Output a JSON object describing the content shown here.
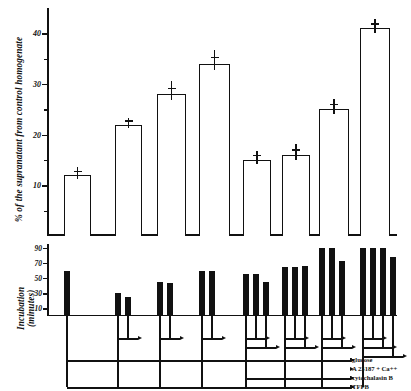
{
  "figure": {
    "type": "two-panel-scientific-figure",
    "top_axis_title": "% of the supranatant from control homogenate",
    "bottom_axis_title_line1": "Incubation",
    "bottom_axis_title_line2": "(minutes)"
  },
  "chart_data": {
    "type": "bar",
    "title": "",
    "xlabel": "",
    "ylabel": "% of the supranatant from control homogenate",
    "ylim": [
      0,
      45
    ],
    "yticks": [
      10,
      20,
      30,
      40
    ],
    "ytick_labels": [
      "10",
      "20",
      "30",
      "40"
    ],
    "grid": false,
    "legend_position": "bottom-right",
    "categories": [
      "1",
      "2",
      "3",
      "4",
      "5",
      "6",
      "7",
      "8"
    ],
    "values": [
      12,
      22,
      28,
      34,
      15,
      16,
      25,
      41
    ],
    "errors": [
      1.4,
      1.2,
      2.2,
      2.4,
      1.6,
      1.8,
      1.8,
      1.6
    ],
    "conditions": [
      "glucose",
      "A 23187 + Ca++",
      "cytochalasin B",
      "TFPB"
    ],
    "timeline": {
      "ylabel": "Incubation (minutes)",
      "ylim": [
        0,
        95
      ],
      "yticks": [
        10,
        30,
        50,
        70,
        90
      ],
      "ytick_labels": [
        "10",
        "30",
        "50",
        "70",
        "90"
      ],
      "groups": [
        {
          "index": 1,
          "bars": [
            60
          ],
          "arrows": [
            "glucose",
            "TFPB"
          ]
        },
        {
          "index": 2,
          "bars": [
            30,
            25
          ],
          "arrows": [
            "glucose",
            "TFPB"
          ]
        },
        {
          "index": 3,
          "bars": [
            45,
            43
          ],
          "arrows": [
            "glucose",
            "TFPB"
          ]
        },
        {
          "index": 4,
          "bars": [
            60,
            60
          ],
          "arrows": [
            "glucose",
            "TFPB"
          ]
        },
        {
          "index": 5,
          "bars": [
            55,
            55,
            45
          ],
          "arrows": [
            "glucose",
            "cytochalasin B",
            "TFPB"
          ]
        },
        {
          "index": 6,
          "bars": [
            65,
            65,
            66
          ],
          "arrows": [
            "glucose",
            "cytochalasin B",
            "TFPB"
          ]
        },
        {
          "index": 7,
          "bars": [
            90,
            90,
            72
          ],
          "arrows": [
            "glucose",
            "cytochalasin B",
            "TFPB"
          ]
        },
        {
          "index": 8,
          "bars": [
            90,
            90,
            90,
            78
          ],
          "arrows": [
            "glucose",
            "A 23187 + Ca++",
            "cytochalasin B",
            "TFPB"
          ]
        }
      ]
    }
  },
  "legend": {
    "items": [
      {
        "label": "glucose"
      },
      {
        "label": "A 23187 + Ca++"
      },
      {
        "label": "cytochalasin B"
      },
      {
        "label": "TFPB"
      }
    ]
  }
}
